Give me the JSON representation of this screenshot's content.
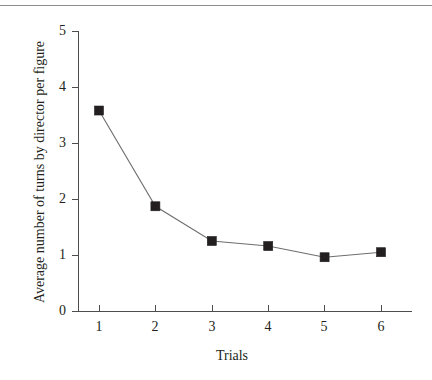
{
  "figure": {
    "has_top_rule": true,
    "background_color": "#ffffff",
    "ink_color": "#231f20",
    "line_color": "#6e6e6e"
  },
  "chart_data": {
    "type": "line",
    "title": "",
    "subtitle": "",
    "xlabel": "Trials",
    "ylabel": "Average number of turns by director per figure",
    "x": [
      1,
      2,
      3,
      4,
      5,
      6
    ],
    "categories": [
      "1",
      "2",
      "3",
      "4",
      "5",
      "6"
    ],
    "values": [
      3.58,
      1.87,
      1.25,
      1.16,
      0.96,
      1.05
    ],
    "series": [
      {
        "name": "Average number of turns by director per figure",
        "values": [
          3.58,
          1.87,
          1.25,
          1.16,
          0.96,
          1.05
        ],
        "marker": "filled-square",
        "marker_color": "#231f20",
        "line_color": "#6e6e6e"
      }
    ],
    "xlim": [
      0.6,
      6.6
    ],
    "ylim": [
      0,
      5
    ],
    "xticks": [
      1,
      2,
      3,
      4,
      5,
      6
    ],
    "yticks": [
      0,
      1,
      2,
      3,
      4,
      5
    ],
    "xtick_labels": [
      "1",
      "2",
      "3",
      "4",
      "5",
      "6"
    ],
    "ytick_labels": [
      "0",
      "1",
      "2",
      "3",
      "4",
      "5"
    ],
    "grid": false,
    "legend": false,
    "legend_position": "none",
    "annotations": []
  }
}
